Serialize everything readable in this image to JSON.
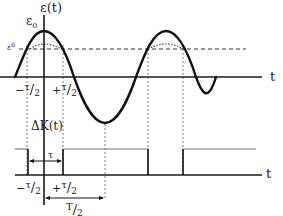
{
  "top_graph": {
    "y_axis_label": "ε(t)",
    "peak_label": "ε",
    "peak_label_sub": "0",
    "threshold_label": "ε",
    "threshold_label_sup": "0",
    "x_axis_label": "t",
    "tick_neg": {
      "sign": "−",
      "num": "τ",
      "den": "2"
    },
    "tick_pos": {
      "sign": "+",
      "num": "τ",
      "den": "2"
    }
  },
  "bottom_graph": {
    "y_axis_label": "ΔK(t)",
    "x_axis_label": "t",
    "tau_label": "τ",
    "tick_neg": {
      "sign": "−",
      "num": "τ",
      "den": "2"
    },
    "tick_pos": {
      "sign": "+",
      "num": "τ",
      "den": "2"
    },
    "half_period": {
      "num": "T",
      "den": "2"
    }
  },
  "colors": {
    "curve": "#111111",
    "axis": "#1a1a1a",
    "dashed": "#333333",
    "dotted": "#555555",
    "pulse_high": "#777777"
  }
}
